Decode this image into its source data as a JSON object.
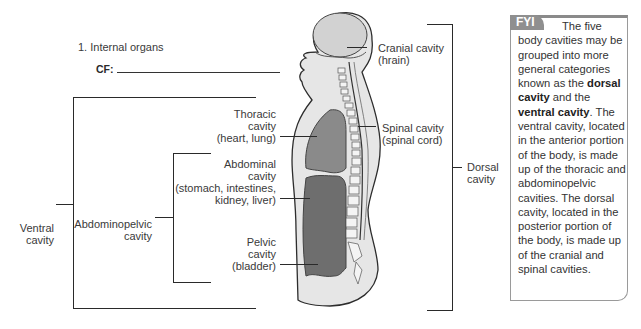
{
  "exercise": {
    "number_label": "1. Internal organs",
    "cf_label": "CF:",
    "cf_value": ""
  },
  "labels": {
    "cranial": [
      "Cranial cavity",
      "(hrain)"
    ],
    "spinal": [
      "Spinal cavity",
      "(spinal cord)"
    ],
    "thoracic": [
      "Thoracic",
      "cavity",
      "(heart, lung)"
    ],
    "abdominal": [
      "Abdominal",
      "cavity",
      "(stomach, intestines,",
      "kidney, liver)"
    ],
    "pelvic": [
      "Pelvic",
      "cavity",
      "(bladder)"
    ],
    "abdominopelvic": [
      "Abdominopelvic",
      "cavity"
    ],
    "ventral": [
      "Ventral",
      "cavity"
    ],
    "dorsal": [
      "Dorsal",
      "cavity"
    ]
  },
  "fyi": {
    "badge": "FYI",
    "text_1": "The five body cavities may be grouped into more general categories known as the ",
    "bold_1": "dorsal cavity",
    "text_2": " and the ",
    "bold_2": "ventral cavity",
    "text_3": ". The ventral cavity, located in the anterior portion of the body, is made up of the thoracic and abdominopelvic cavities. The dorsal cavity, located in the posterior portion of the body, is made up of the cranial and spinal cavities."
  },
  "colors": {
    "badge_bg": "#8f8f8f",
    "box_border": "#9a9a9a",
    "body_fill": "#e6e6e6",
    "organ_cavity": "#7a7a7a",
    "brain": "#d4d4d4"
  }
}
